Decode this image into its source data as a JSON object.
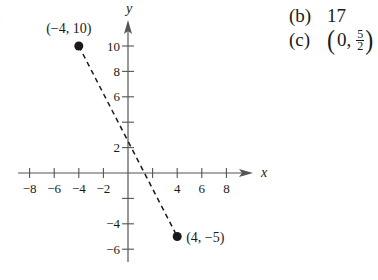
{
  "part_a_cut_label": ")",
  "answers": {
    "b": {
      "label": "(b)",
      "value": "17"
    },
    "c": {
      "label": "(c)",
      "open": "(",
      "x": "0,",
      "frac_num": "5",
      "frac_den": "2",
      "close": ")"
    }
  },
  "chart_data": {
    "type": "scatter",
    "title": "",
    "xlabel": "x",
    "ylabel": "y",
    "xlim": [
      -9,
      10
    ],
    "ylim": [
      -7,
      12
    ],
    "grid": false,
    "x_ticks": [
      -8,
      -6,
      -4,
      -2,
      2,
      4,
      6,
      8
    ],
    "x_tick_labels": [
      "-8",
      "-6",
      "-4",
      "-2",
      "",
      "4",
      "6",
      "8"
    ],
    "y_ticks": [
      -6,
      -4,
      -2,
      2,
      4,
      6,
      8,
      10
    ],
    "y_tick_labels": [
      "-6",
      "-4",
      "",
      "2",
      "",
      "6",
      "8",
      "10"
    ],
    "points": [
      {
        "x": -4,
        "y": 10,
        "label": "(−4, 10)"
      },
      {
        "x": 4,
        "y": -5,
        "label": "(4, −5)"
      }
    ],
    "segments": [
      {
        "from": [
          -4,
          10
        ],
        "to": [
          4,
          -5
        ],
        "style": "dashed"
      }
    ],
    "colors": {
      "ink": "#1a1a1a",
      "axis": "#555555"
    }
  }
}
